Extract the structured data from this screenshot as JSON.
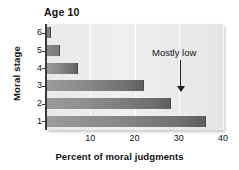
{
  "chart_data": {
    "type": "bar",
    "orientation": "horizontal",
    "title": "Age 10",
    "xlabel": "Percent of moral judgments",
    "ylabel": "Moral stage",
    "categories": [
      "6",
      "5",
      "4",
      "3",
      "2",
      "1"
    ],
    "values": [
      1,
      3,
      7,
      22,
      28,
      36
    ],
    "xlim": [
      0,
      40
    ],
    "xticks": [
      "10",
      "20",
      "30",
      "40"
    ],
    "xtick_values": [
      10,
      20,
      30,
      40
    ],
    "grid": "vertical-gridlines-only",
    "legend": "none",
    "annotations": [
      {
        "text": "Mostly low",
        "points_to_category": "1",
        "arrow": "down-arrow"
      }
    ],
    "series": [
      {
        "name": "Percent of moral judgments",
        "values": [
          1,
          3,
          7,
          22,
          28,
          36
        ]
      }
    ],
    "colors": {
      "bar_fill_light": "#9b9b9b",
      "bar_fill_dark": "#5e5e5e",
      "plot_background": "#ececec",
      "gridline": "#ffffff",
      "axis": "#3a3a3a",
      "text": "#111111"
    }
  }
}
